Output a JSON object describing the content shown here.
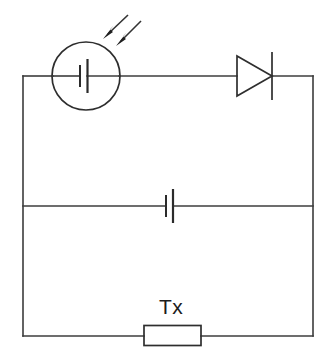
{
  "diagram": {
    "background_color": "#ffffff",
    "line_color": "#3c3c3c",
    "part_color": "#2e2e2e",
    "text_color": "#1c1c1c",
    "canvas": {
      "width": 336,
      "height": 356
    }
  },
  "labels": {
    "resistor_label": "Tx"
  },
  "components": {
    "solar_cell": {
      "name": "photovoltaic-cell",
      "circle": {
        "cx": 86,
        "cy": 76,
        "r": 34
      },
      "plate_short_x": 80,
      "plate_long_x": 87,
      "plate_short_half_height": 11,
      "plate_long_half_height": 17
    },
    "light_rays": {
      "name": "incident-light-arrows",
      "count": 2,
      "ray_one": {
        "x1": 128,
        "y1": 15,
        "x2": 104,
        "y2": 38
      },
      "ray_two": {
        "x1": 141,
        "y1": 21,
        "x2": 117,
        "y2": 45
      }
    },
    "diode": {
      "name": "diode",
      "triangle": {
        "apex_x": 272,
        "top_y": 56,
        "bottom_y": 96,
        "back_x": 237
      },
      "cathode_bar_x": 272,
      "cathode_bar_top": 52,
      "cathode_bar_bottom": 100
    },
    "battery": {
      "name": "battery-cell",
      "plate_short_x": 166,
      "plate_long_x": 173,
      "plate_short_half_height": 11,
      "plate_long_half_height": 17,
      "wire_y": 206
    },
    "resistor": {
      "name": "resistor-tx",
      "box": {
        "x": 144,
        "y": 325,
        "width": 57,
        "height": 20
      }
    }
  },
  "wires": {
    "frame": {
      "left_x": 23,
      "right_x": 313,
      "top_y": 76,
      "bottom_y": 336
    },
    "middle_y": 206
  }
}
